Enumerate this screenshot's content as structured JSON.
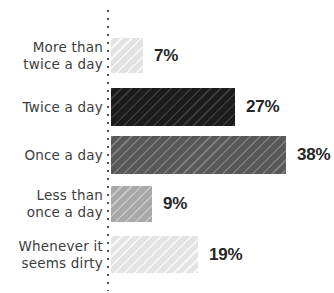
{
  "chart_data": {
    "type": "bar",
    "orientation": "horizontal",
    "title": "",
    "xlabel": "",
    "ylabel": "",
    "xlim": [
      0,
      40
    ],
    "grid": false,
    "legend": false,
    "axis_line_style": "dotted-vertical",
    "categories": [
      "More than\ntwice a day",
      "Twice a day",
      "Once a day",
      "Less than\nonce a day",
      "Whenever it\nseems dirty"
    ],
    "values": [
      7,
      27,
      38,
      9,
      19
    ],
    "value_labels": [
      "7%",
      "27%",
      "38%",
      "9%",
      "19%"
    ],
    "bar_colors": [
      "#e2e2e2",
      "#1b1b1b",
      "#585858",
      "#a8a8a8",
      "#e4e4e4"
    ],
    "bar_pattern": "diagonal-hatch"
  },
  "colors": {
    "background": "#ffffff",
    "category_label_text": "#3d3d3d",
    "value_label_text": "#262626",
    "axis_dots": "#4f4f4f"
  }
}
